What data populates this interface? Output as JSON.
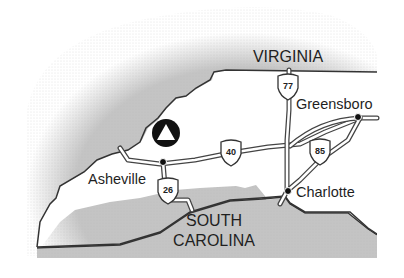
{
  "map": {
    "colors": {
      "background": "#ffffff",
      "neighbor_fill": "#c4c4c4",
      "nc_fill": "#ffffff",
      "outline": "#333333",
      "road": "#444444",
      "text": "#1f1f1f"
    },
    "states": [
      {
        "name": "VIRGINIA",
        "lines": [
          "VIRGINIA"
        ]
      },
      {
        "name": "SOUTH CAROLINA",
        "lines": [
          "SOUTH",
          "CAROLINA"
        ]
      }
    ],
    "cities": [
      {
        "name": "Greensboro"
      },
      {
        "name": "Asheville"
      },
      {
        "name": "Charlotte"
      }
    ],
    "interstates": [
      {
        "number": "77"
      },
      {
        "number": "40"
      },
      {
        "number": "85"
      },
      {
        "number": "26"
      }
    ],
    "marker": {
      "icon": "triangle-in-circle-icon"
    }
  }
}
